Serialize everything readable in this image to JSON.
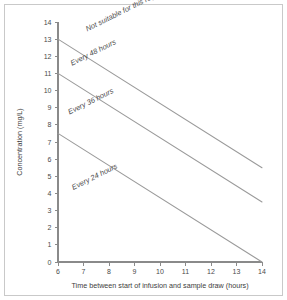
{
  "figure": {
    "background_color": "#ffffff",
    "frame_color": "#c9c9c9",
    "line_color": "#9a9a9a",
    "axis_color": "#8a8a8a",
    "text_color": "#4a4a4a"
  },
  "chart_data": {
    "type": "line",
    "title": "",
    "xlabel": "Time between start of infusion and sample draw (hours)",
    "ylabel": "Concentration (mg/L)",
    "xlim": [
      6,
      14
    ],
    "ylim": [
      0,
      14
    ],
    "xticks": [
      6,
      7,
      8,
      9,
      10,
      11,
      12,
      13,
      14
    ],
    "xtick_labels": [
      "6",
      "7",
      "8",
      "9",
      "10",
      "11",
      "12",
      "13",
      "14"
    ],
    "yticks": [
      0,
      1,
      2,
      3,
      4,
      5,
      6,
      7,
      8,
      9,
      10,
      11,
      12,
      13,
      14
    ],
    "ytick_labels": [
      "0",
      "1",
      "2",
      "3",
      "4",
      "5",
      "6",
      "7",
      "8",
      "9",
      "10",
      "11",
      "12",
      "13",
      "14"
    ],
    "grid": false,
    "legend": "none",
    "markers": false,
    "series": [
      {
        "name": "upper-boundary",
        "x": [
          6,
          14
        ],
        "values": [
          13.0,
          5.5
        ],
        "color": "#9a9a9a"
      },
      {
        "name": "middle-boundary",
        "x": [
          6,
          14
        ],
        "values": [
          11.0,
          3.5
        ],
        "color": "#9a9a9a"
      },
      {
        "name": "lower-boundary",
        "x": [
          6,
          14
        ],
        "values": [
          7.5,
          0.0
        ],
        "color": "#9a9a9a"
      }
    ],
    "annotations": [
      {
        "text": "Not suitable for this regimen",
        "x": 7.15,
        "y": 13.45,
        "rotation": -26.5
      },
      {
        "text": "Every 48 hours",
        "x": 6.55,
        "y": 11.45,
        "rotation": -26.5
      },
      {
        "text": "Every 36 hours",
        "x": 6.45,
        "y": 8.6,
        "rotation": -26.5
      },
      {
        "text": "Every 24 hours",
        "x": 6.6,
        "y": 4.2,
        "rotation": -26.5
      }
    ]
  }
}
